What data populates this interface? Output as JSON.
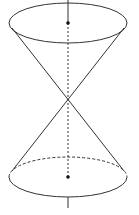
{
  "diagram": {
    "colors": {
      "stroke": "#333333",
      "background": "#ffffff"
    },
    "axis": {
      "x": 68,
      "top_y": 0,
      "bottom_y": 208
    },
    "apex": {
      "x": 68,
      "y": 102
    },
    "top_base": {
      "cx": 68,
      "cy": 23,
      "rx": 59,
      "ry": 20,
      "center_dot": true
    },
    "bottom_base": {
      "cx": 68,
      "cy": 177,
      "rx": 59,
      "ry": 20,
      "center_dot": true,
      "back_half_dashed": true
    }
  }
}
